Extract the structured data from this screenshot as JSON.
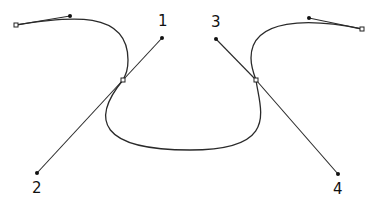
{
  "diagram": {
    "title": "",
    "colors": {
      "stroke": "#2a2a2a",
      "background": "#ffffff"
    },
    "curve_path": "M16,25 C70,16 128,10 128,60 C128,70 126,74 123,80 C90,120 100,150 190,150 C280,150 260,110 256,80 C253,72 251,66 251,58 C251,18 309,18 362,29",
    "anchors": [
      {
        "id": "left-end-anchor",
        "x": 16,
        "y": 25
      },
      {
        "id": "left-mid-anchor",
        "x": 123,
        "y": 80
      },
      {
        "id": "right-mid-anchor",
        "x": 256,
        "y": 80
      },
      {
        "id": "right-end-anchor",
        "x": 362,
        "y": 29
      }
    ],
    "handles": [
      {
        "id": "left-end-handle",
        "from": [
          16,
          25
        ],
        "to": [
          70,
          16
        ],
        "label": ""
      },
      {
        "id": "handle-1",
        "from": [
          123,
          80
        ],
        "to": [
          162,
          38
        ],
        "label": "1",
        "label_pos": [
          158,
          26
        ]
      },
      {
        "id": "handle-2",
        "from": [
          123,
          80
        ],
        "to": [
          37,
          173
        ],
        "label": "2",
        "label_pos": [
          32,
          193
        ]
      },
      {
        "id": "handle-3",
        "from": [
          256,
          80
        ],
        "to": [
          216,
          39
        ],
        "label": "3",
        "label_pos": [
          212,
          27
        ]
      },
      {
        "id": "handle-4",
        "from": [
          256,
          80
        ],
        "to": [
          338,
          174
        ],
        "label": "4",
        "label_pos": [
          333,
          194
        ]
      },
      {
        "id": "right-end-handle",
        "from": [
          362,
          29
        ],
        "to": [
          309,
          18
        ],
        "label": ""
      }
    ],
    "labels": [
      "1",
      "2",
      "3",
      "4"
    ]
  }
}
